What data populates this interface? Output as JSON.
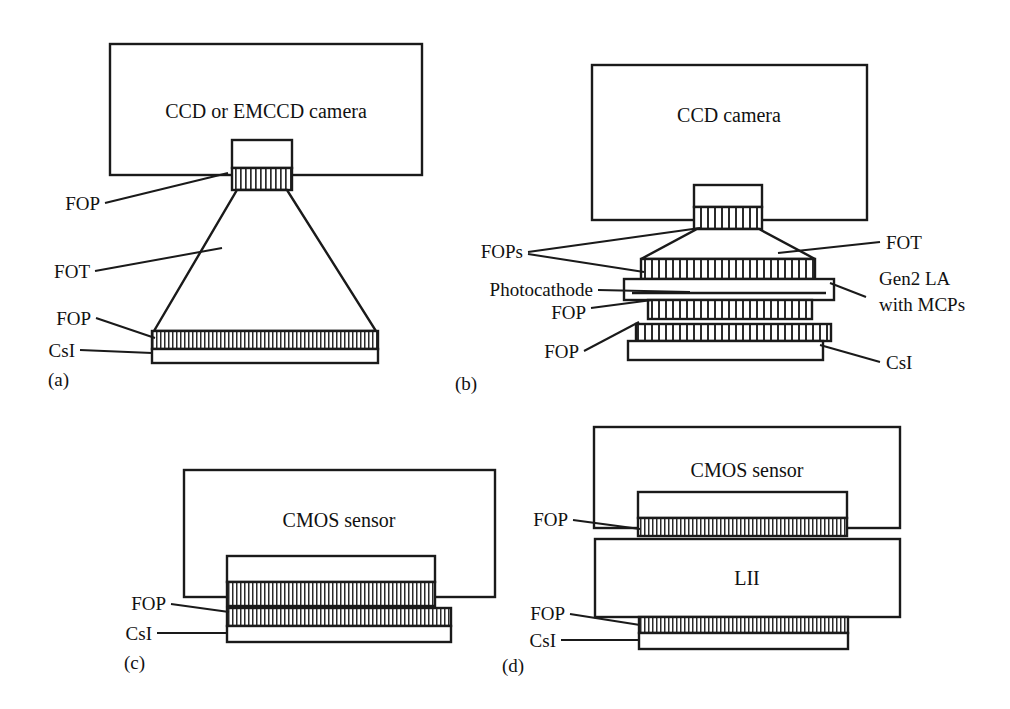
{
  "figure": {
    "caption": "",
    "line_color": "#1a1a1a",
    "fill_color": "#ffffff",
    "hatch_color": "#2b2b2b"
  },
  "panels": [
    {
      "id": "(a)",
      "detector_label": "CCD or EMCCD camera",
      "labels": [
        {
          "name": "fop-top",
          "text": "FOP"
        },
        {
          "name": "fot",
          "text": "FOT"
        },
        {
          "name": "fop-bottom",
          "text": "FOP"
        },
        {
          "name": "csi",
          "text": "CsI"
        }
      ]
    },
    {
      "id": "(b)",
      "detector_label": "CCD camera",
      "labels": [
        {
          "name": "fops",
          "text": "FOPs"
        },
        {
          "name": "fot",
          "text": "FOT"
        },
        {
          "name": "photocathode",
          "text": "Photocathode"
        },
        {
          "name": "gen2-line1",
          "text": "Gen2 LA"
        },
        {
          "name": "gen2-line2",
          "text": "with MCPs"
        },
        {
          "name": "fop-mid",
          "text": "FOP"
        },
        {
          "name": "fop-bottom",
          "text": "FOP"
        },
        {
          "name": "csi",
          "text": "CsI"
        }
      ]
    },
    {
      "id": "(c)",
      "detector_label": "CMOS sensor",
      "labels": [
        {
          "name": "fop",
          "text": "FOP"
        },
        {
          "name": "csi",
          "text": "CsI"
        }
      ]
    },
    {
      "id": "(d)",
      "detector_label": "CMOS sensor",
      "intensifier_label": "LII",
      "labels": [
        {
          "name": "fop-top",
          "text": "FOP"
        },
        {
          "name": "fop-bottom",
          "text": "FOP"
        },
        {
          "name": "csi",
          "text": "CsI"
        }
      ]
    }
  ],
  "text": {
    "a_camera": "CCD or EMCCD camera",
    "a_fop_top": "FOP",
    "a_fot": "FOT",
    "a_fop_bot": "FOP",
    "a_csi": "CsI",
    "a_id": "(a)",
    "b_camera": "CCD camera",
    "b_fops": "FOPs",
    "b_fot": "FOT",
    "b_photocathode": "Photocathode",
    "b_gen2_l1": "Gen2 LA",
    "b_gen2_l2": "with MCPs",
    "b_fop_mid": "FOP",
    "b_fop_bot": "FOP",
    "b_csi": "CsI",
    "b_id": "(b)",
    "c_sensor": "CMOS sensor",
    "c_fop": "FOP",
    "c_csi": "CsI",
    "c_id": "(c)",
    "d_sensor": "CMOS sensor",
    "d_lii": "LII",
    "d_fop_top": "FOP",
    "d_fop_bot": "FOP",
    "d_csi": "CsI",
    "d_id": "(d)"
  }
}
